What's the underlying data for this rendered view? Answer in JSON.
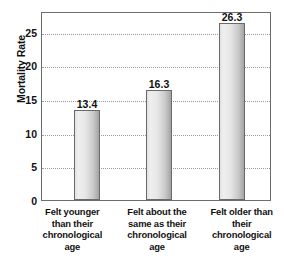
{
  "chart_data": {
    "type": "bar",
    "title": "",
    "xlabel": "",
    "ylabel": "Mortality Rate",
    "categories": [
      "Felt younger than their chronological age",
      "Felt about the same as their chronological age",
      "Felt older than their chronological age"
    ],
    "category_lines": [
      [
        "Felt younger",
        "than their",
        "chronological",
        "age"
      ],
      [
        "Felt about the",
        "same as their",
        "chronological",
        "age"
      ],
      [
        "Felt older than",
        "their",
        "chronological",
        "age"
      ]
    ],
    "values": [
      13.4,
      16.3,
      26.3
    ],
    "value_labels": [
      "13.4",
      "16.3",
      "26.3"
    ],
    "ylim": [
      0,
      28.1
    ],
    "yticks": [
      0,
      5,
      10,
      15,
      20,
      25
    ],
    "ytick_labels": [
      "0",
      "5",
      "10",
      "15",
      "20",
      "25"
    ],
    "gridlines": [
      5,
      10,
      15,
      20,
      25
    ],
    "grid": true,
    "grid_style": "dotted",
    "legend": null,
    "bar_color_left": "#efefef",
    "bar_color_right": "#a4a4a4",
    "bar_border_color": "#6a6a6a",
    "frame_color": "#6d6d6d",
    "grid_color": "#9a9a9a",
    "text_color": "#111111",
    "background": "#ffffff"
  }
}
